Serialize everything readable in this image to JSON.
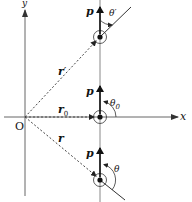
{
  "diagram": {
    "axes": {
      "x_label": "x",
      "y_label": "y",
      "origin_label": "O"
    },
    "positions": [
      {
        "id": "upper",
        "momentum_label": "p",
        "position_vector_label": "r",
        "position_vector_prime": "′",
        "angle_label": "θ",
        "angle_prime": "′"
      },
      {
        "id": "middle",
        "momentum_label": "p",
        "position_vector_label": "r",
        "position_vector_sub": "0",
        "angle_label": "θ",
        "angle_sub": "0"
      },
      {
        "id": "lower",
        "momentum_label": "p",
        "position_vector_label": "r",
        "angle_label": "θ"
      }
    ],
    "colors": {
      "line": "#222222",
      "axis": "#555555",
      "dashed": "#444444"
    }
  }
}
